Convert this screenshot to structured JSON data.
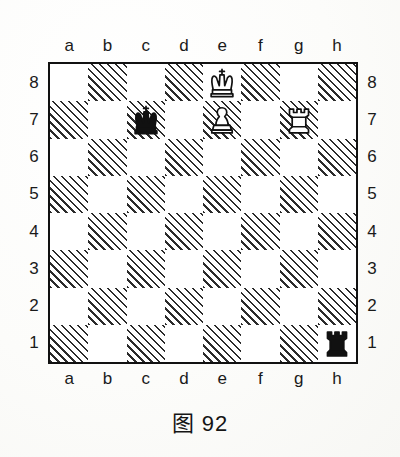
{
  "caption": "图 92",
  "board": {
    "files_top": [
      "a",
      "b",
      "c",
      "d",
      "e",
      "f",
      "g",
      "h"
    ],
    "files_bottom": [
      "a",
      "b",
      "c",
      "d",
      "e",
      "f",
      "g",
      "h"
    ],
    "ranks_left": [
      "8",
      "7",
      "6",
      "5",
      "4",
      "3",
      "2",
      "1"
    ],
    "ranks_right": [
      "8",
      "7",
      "6",
      "5",
      "4",
      "3",
      "2",
      "1"
    ],
    "light_square_color": "#ffffff",
    "dark_square_color": "#2b2b2b",
    "dark_square_style": "diagonal-hatch",
    "border_color": "#111111",
    "orientation": "white-bottom"
  },
  "pieces": [
    {
      "square": "e8",
      "file": "e",
      "rank": "8",
      "color": "white",
      "type": "king",
      "glyph": "♔",
      "name": "white-king"
    },
    {
      "square": "c7",
      "file": "c",
      "rank": "7",
      "color": "black",
      "type": "king",
      "glyph": "♚",
      "name": "black-king"
    },
    {
      "square": "e7",
      "file": "e",
      "rank": "7",
      "color": "white",
      "type": "pawn",
      "glyph": "♙",
      "name": "white-pawn"
    },
    {
      "square": "g7",
      "file": "g",
      "rank": "7",
      "color": "white",
      "type": "rook",
      "glyph": "♖",
      "name": "white-rook"
    },
    {
      "square": "h1",
      "file": "h",
      "rank": "1",
      "color": "black",
      "type": "rook",
      "glyph": "♜",
      "name": "black-rook"
    }
  ],
  "fen": "4K3/2k1P1R1/8/8/8/8/8/7r"
}
